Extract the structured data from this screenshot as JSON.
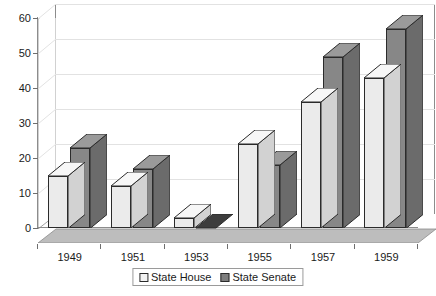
{
  "chart_data": {
    "type": "bar",
    "title": "",
    "xlabel": "",
    "ylabel": "",
    "categories": [
      "1949",
      "1951",
      "1953",
      "1955",
      "1957",
      "1959"
    ],
    "series": [
      {
        "name": "State House",
        "color": "#ebebeb",
        "values": [
          15,
          12,
          3,
          24,
          36,
          43
        ]
      },
      {
        "name": "State Senate",
        "color": "#878787",
        "values": [
          23,
          17,
          0,
          18,
          49,
          57
        ]
      }
    ],
    "ylim": [
      0,
      60
    ],
    "ytick_values": [
      0,
      10,
      20,
      30,
      40,
      50,
      60
    ],
    "ytick_labels": [
      "0",
      "10",
      "20",
      "30",
      "40",
      "50",
      "60"
    ],
    "grid": true,
    "grid_axis": "y",
    "legend_position": "bottom-center",
    "three_d": true
  },
  "axes": {
    "y_labels": [
      "60",
      "50",
      "40",
      "30",
      "20",
      "10",
      "0"
    ],
    "x_labels": [
      "1949",
      "1951",
      "1953",
      "1955",
      "1957",
      "1959"
    ]
  },
  "legend": {
    "items": [
      {
        "label": "State House"
      },
      {
        "label": "State Senate"
      }
    ]
  },
  "colors": {
    "house_face": "#ebebeb",
    "house_side": "#d2d2d2",
    "house_top": "#f7f7f7",
    "senate_face": "#878787",
    "senate_side": "#6b6b6b",
    "senate_top": "#9a9a9a",
    "gridline": "#e2e2e2",
    "axis": "#8c8c8c",
    "floor": "#bdbdbd",
    "wall": "#ffffff",
    "text": "#1a1a1a"
  }
}
